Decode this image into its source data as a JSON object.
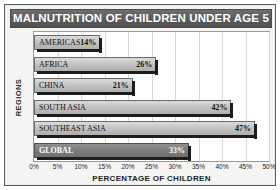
{
  "chart_data": {
    "type": "bar",
    "orientation": "horizontal",
    "title": "MALNUTRITION OF CHILDREN UNDER AGE 5",
    "xlabel": "PERCENTAGE OF CHILDREN",
    "ylabel": "REGIONS",
    "categories": [
      "AMERICAS",
      "AFRICA",
      "CHINA",
      "SOUTH ASIA",
      "SOUTHEAST ASIA",
      "GLOBAL"
    ],
    "values": [
      14,
      26,
      21,
      42,
      47,
      33
    ],
    "value_labels": [
      "14%",
      "26%",
      "21%",
      "42%",
      "47%",
      "33%"
    ],
    "highlight_category": "GLOBAL",
    "xlim": [
      0,
      50
    ],
    "xtick_labels": [
      "0%",
      "5%",
      "10%",
      "15%",
      "20%",
      "25%",
      "30%",
      "35%",
      "40%",
      "45%",
      "50%"
    ],
    "xtick_values": [
      0,
      5,
      10,
      15,
      20,
      25,
      30,
      35,
      40,
      45,
      50
    ],
    "grid": "vertical",
    "legend": "none",
    "colors": {
      "title_banner": "#5a5a5a",
      "title_text": "#ffffff",
      "bar_fill": "#c4c4c4",
      "bar_border": "#6b6b6b",
      "bar_highlight_fill": "#7d7d7d",
      "bar_shadow": "#1d1d1d",
      "plot_background": "#ffffff",
      "gridline": "#d8d8d8",
      "frame_background": "#f4f4f2",
      "frame_border": "#5d5d5d"
    }
  }
}
